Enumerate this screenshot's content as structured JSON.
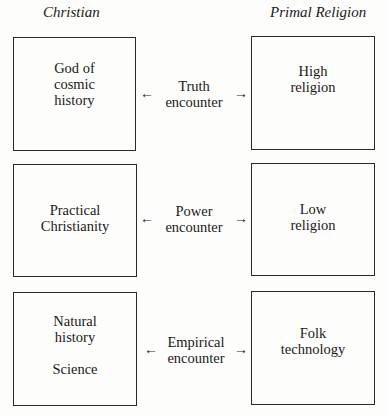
{
  "columns": {
    "left_title": "Christian",
    "right_title": "Primal Religion"
  },
  "rows": [
    {
      "left": [
        "God of",
        "cosmic",
        "history"
      ],
      "encounter": [
        "Truth",
        "encounter"
      ],
      "right": [
        "High",
        "religion"
      ]
    },
    {
      "left": [
        "Practical",
        "Christianity"
      ],
      "encounter": [
        "Power",
        "encounter"
      ],
      "right": [
        "Low",
        "religion"
      ]
    },
    {
      "left": [
        "Natural",
        "history"
      ],
      "left_extra": "Science",
      "encounter": [
        "Empirical",
        "encounter"
      ],
      "right": [
        "Folk",
        "technology"
      ]
    }
  ],
  "arrows": {
    "left": "←",
    "right": "→"
  }
}
